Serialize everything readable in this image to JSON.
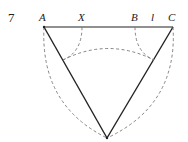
{
  "figure": {
    "number": "7",
    "labels": {
      "A": "A",
      "X": "X",
      "B": "B",
      "l": "l",
      "C": "C"
    }
  }
}
